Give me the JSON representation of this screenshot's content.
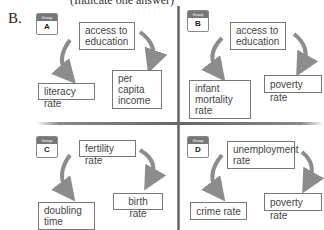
{
  "question": {
    "letter": "B.",
    "clipped_header": "(Indicate one answer)"
  },
  "groups": [
    {
      "label": "Group",
      "letter": "A",
      "top": "access to education",
      "left": "literacy rate",
      "right": "per capita income"
    },
    {
      "label": "Group",
      "letter": "B",
      "top": "access to education",
      "left": "infant mortality rate",
      "right": "poverty rate"
    },
    {
      "label": "Group",
      "letter": "C",
      "top": "fertility rate",
      "left": "doubling time",
      "right": "birth rate"
    },
    {
      "label": "Group",
      "letter": "D",
      "top": "unemployment rate",
      "left": "crime rate",
      "right": "poverty rate"
    }
  ],
  "colors": {
    "arrow": "#8c8c8c",
    "box_border": "#777777",
    "group_header": "#777777"
  }
}
